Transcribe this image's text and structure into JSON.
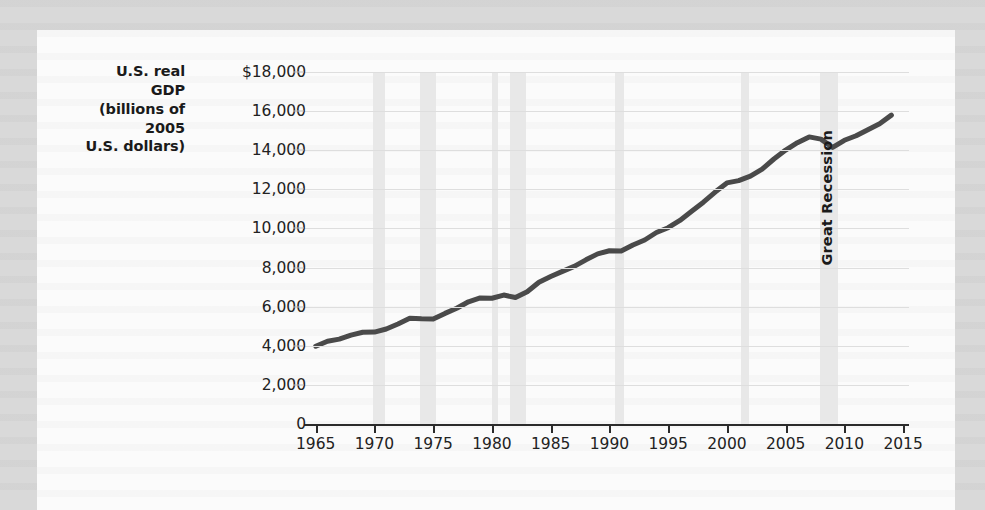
{
  "chart_data": {
    "type": "line",
    "title": "",
    "ylabel": "U.S. real GDP (billions of 2005 U.S. dollars)",
    "xlabel": "",
    "xlim": [
      1964,
      2015.5
    ],
    "ylim": [
      0,
      18000
    ],
    "grid": true,
    "legend": "none",
    "y_ticks": [
      {
        "value": 0,
        "label": "0"
      },
      {
        "value": 2000,
        "label": "2,000"
      },
      {
        "value": 4000,
        "label": "4,000"
      },
      {
        "value": 6000,
        "label": "6,000"
      },
      {
        "value": 8000,
        "label": "8,000"
      },
      {
        "value": 10000,
        "label": "10,000"
      },
      {
        "value": 12000,
        "label": "12,000"
      },
      {
        "value": 14000,
        "label": "14,000"
      },
      {
        "value": 16000,
        "label": "16,000"
      },
      {
        "value": 18000,
        "label": "$18,000"
      }
    ],
    "x_ticks": [
      {
        "value": 1965,
        "label": "1965"
      },
      {
        "value": 1970,
        "label": "1970"
      },
      {
        "value": 1975,
        "label": "1975"
      },
      {
        "value": 1980,
        "label": "1980"
      },
      {
        "value": 1985,
        "label": "1985"
      },
      {
        "value": 1990,
        "label": "1990"
      },
      {
        "value": 1995,
        "label": "1995"
      },
      {
        "value": 2000,
        "label": "2000"
      },
      {
        "value": 2005,
        "label": "2005"
      },
      {
        "value": 2010,
        "label": "2010"
      },
      {
        "value": 2015,
        "label": "2015"
      }
    ],
    "series": [
      {
        "name": "U.S. real GDP",
        "color": "#4a4a4a",
        "x": [
          1965,
          1966,
          1967,
          1968,
          1969,
          1970,
          1971,
          1972,
          1973,
          1974,
          1975,
          1976,
          1977,
          1978,
          1979,
          1980,
          1981,
          1982,
          1983,
          1984,
          1985,
          1986,
          1987,
          1988,
          1989,
          1990,
          1991,
          1992,
          1993,
          1994,
          1995,
          1996,
          1997,
          1998,
          1999,
          2000,
          2001,
          2002,
          2003,
          2004,
          2005,
          2006,
          2007,
          2008,
          2009,
          2010,
          2011,
          2012,
          2013,
          2014
        ],
        "values": [
          3976,
          4235,
          4340,
          4548,
          4692,
          4702,
          4857,
          5114,
          5405,
          5378,
          5367,
          5655,
          5917,
          6249,
          6447,
          6430,
          6593,
          6469,
          6765,
          7251,
          7542,
          7805,
          8060,
          8395,
          8700,
          8861,
          8845,
          9154,
          9409,
          9792,
          10036,
          10409,
          10876,
          11342,
          11859,
          12328,
          12447,
          12673,
          13034,
          13551,
          14007,
          14387,
          14682,
          14565,
          14143,
          14508,
          14738,
          15051,
          15357,
          15794
        ],
        "units": "billions of 2005 U.S. dollars"
      }
    ],
    "recession_bands": [
      {
        "start": 1969.9,
        "end": 1970.9,
        "label": ""
      },
      {
        "start": 1973.9,
        "end": 1975.2,
        "label": ""
      },
      {
        "start": 1980.0,
        "end": 1980.5,
        "label": ""
      },
      {
        "start": 1981.5,
        "end": 1982.9,
        "label": ""
      },
      {
        "start": 1990.5,
        "end": 1991.2,
        "label": ""
      },
      {
        "start": 2001.2,
        "end": 2001.9,
        "label": ""
      },
      {
        "start": 2007.9,
        "end": 2009.5,
        "label": "Great Recession"
      }
    ],
    "annotations": [
      {
        "text": "Great Recession",
        "x": 2008.6,
        "orientation": "vertical"
      }
    ],
    "colors": {
      "line": "#4a4a4a",
      "gridline": "#dedede",
      "recession_band": "#e8e8e8",
      "axis": "#2b2b2b",
      "panel_background": "#fbfbfb",
      "page_background": "#d9d9d9"
    }
  }
}
